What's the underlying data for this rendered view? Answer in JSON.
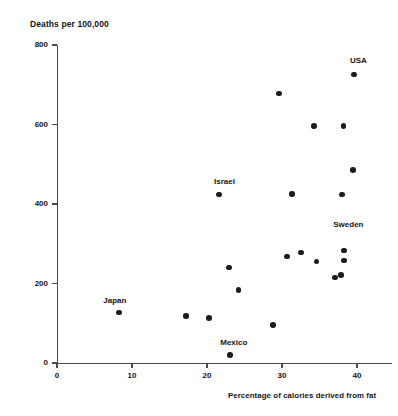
{
  "chart_data": {
    "type": "scatter",
    "title": "",
    "ylabel": "Deaths per 100,000",
    "xlabel": "Percentage of calories derived from fat",
    "xlim": [
      0,
      44.7
    ],
    "ylim": [
      0,
      800
    ],
    "xticks": [
      0,
      10,
      20,
      30,
      40
    ],
    "yticks": [
      0,
      200,
      400,
      600,
      800
    ],
    "grid": false,
    "legend": null,
    "points": [
      {
        "x": 8.3,
        "y": 127,
        "label": "Japan",
        "label_dx": -16,
        "label_dy": -17
      },
      {
        "x": 17.2,
        "y": 118,
        "label": null
      },
      {
        "x": 20.3,
        "y": 113,
        "label": null
      },
      {
        "x": 23.1,
        "y": 20,
        "label": "Mexico",
        "label_dx": -10,
        "label_dy": -17
      },
      {
        "x": 22.9,
        "y": 240,
        "label": null
      },
      {
        "x": 24.2,
        "y": 184,
        "label": null
      },
      {
        "x": 21.6,
        "y": 424,
        "label": "Israel",
        "label_dx": -5,
        "label_dy": -17
      },
      {
        "x": 28.8,
        "y": 95,
        "label": null
      },
      {
        "x": 29.6,
        "y": 678,
        "label": null
      },
      {
        "x": 31.3,
        "y": 425,
        "label": null
      },
      {
        "x": 30.7,
        "y": 268,
        "label": null
      },
      {
        "x": 32.5,
        "y": 278,
        "label": null
      },
      {
        "x": 34.3,
        "y": 596,
        "label": null
      },
      {
        "x": 34.6,
        "y": 255,
        "label": null
      },
      {
        "x": 37.1,
        "y": 215,
        "label": null
      },
      {
        "x": 37.9,
        "y": 222,
        "label": null
      },
      {
        "x": 38.0,
        "y": 424,
        "label": null
      },
      {
        "x": 38.2,
        "y": 596,
        "label": null
      },
      {
        "x": 38.3,
        "y": 283,
        "label": "Sweden",
        "label_dx": -11,
        "label_dy": -31
      },
      {
        "x": 38.3,
        "y": 258,
        "label": null
      },
      {
        "x": 39.6,
        "y": 726,
        "label": "USA",
        "label_dx": -4,
        "label_dy": -18
      },
      {
        "x": 39.5,
        "y": 485,
        "label": null
      }
    ]
  },
  "axes": {
    "y_title": "Deaths per 100,000",
    "x_title": "Percentage of calories derived from fat",
    "ytick_labels": [
      "0",
      "200",
      "400",
      "600",
      "800"
    ],
    "xtick_labels": [
      "0",
      "10",
      "20",
      "30",
      "40"
    ]
  },
  "colors": {
    "marker": "#1c1c1c",
    "axis": "#4a4a4a",
    "text": "#141414",
    "background": "#ffffff"
  }
}
